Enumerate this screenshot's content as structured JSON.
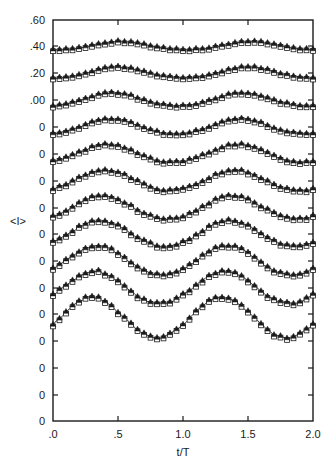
{
  "figure": {
    "background": "#ffffff",
    "ink": "#1a1a1a",
    "frame": {
      "left": 53,
      "right": 313,
      "top": 20,
      "bottom": 421
    }
  },
  "axes": {
    "x": {
      "label": "t/T",
      "ticks": [
        0.0,
        0.5,
        1.0,
        1.5,
        2.0
      ],
      "tick_labels": [
        ".0",
        ".5",
        "1.0",
        "1.5",
        "2.0"
      ],
      "range": [
        0.0,
        2.0
      ]
    },
    "y": {
      "label": "<I>",
      "tick_labels": [
        ".60",
        ".40",
        ".20",
        ".00",
        "0",
        "0",
        "0",
        "0",
        "0",
        "0",
        "0",
        "0",
        "0",
        "0",
        "0"
      ],
      "tick_values": [
        0.6,
        0.4,
        0.2,
        0.0,
        0,
        0,
        0,
        0,
        0,
        0,
        0,
        0,
        0,
        0,
        0
      ],
      "tick_pixels": [
        20,
        46,
        73,
        100,
        127,
        154,
        181,
        208,
        234,
        261,
        288,
        314,
        341,
        368,
        395
      ],
      "range_pixels": [
        421,
        20
      ],
      "note": "stacked offset traces; upper four ticks carry absolute values .00-.60, lower baselines all annotated 0"
    },
    "grid": false,
    "frame_sides": [
      "left",
      "right",
      "top",
      "bottom"
    ],
    "tick_direction": "in"
  },
  "legend": {
    "present": false
  },
  "markers": {
    "series_a": {
      "shape": "triangle-up",
      "fill": "#1a1a1a",
      "size": 4
    },
    "series_b": {
      "shape": "square-open",
      "fill": "#ffffff",
      "stroke": "#1a1a1a",
      "size": 4
    }
  },
  "chart_data": {
    "type": "line",
    "title": "",
    "subtitle": "",
    "xlabel": "t/T",
    "ylabel": "<I>",
    "xlim": [
      0.0,
      2.0
    ],
    "ylim": [
      0.0,
      0.6
    ],
    "grid": false,
    "legend_position": "none",
    "x": [
      0.0,
      0.025,
      0.05,
      0.075,
      0.1,
      0.125,
      0.15,
      0.175,
      0.2,
      0.225,
      0.25,
      0.275,
      0.3,
      0.325,
      0.35,
      0.375,
      0.4,
      0.425,
      0.45,
      0.475,
      0.5,
      0.525,
      0.55,
      0.575,
      0.6,
      0.625,
      0.65,
      0.675,
      0.7,
      0.725,
      0.75,
      0.775,
      0.8,
      0.825,
      0.85,
      0.875,
      0.9,
      0.925,
      0.95,
      0.975,
      1.0,
      1.025,
      1.05,
      1.075,
      1.1,
      1.125,
      1.15,
      1.175,
      1.2,
      1.225,
      1.25,
      1.275,
      1.3,
      1.325,
      1.35,
      1.375,
      1.4,
      1.425,
      1.45,
      1.475,
      1.5,
      1.525,
      1.55,
      1.575,
      1.6,
      1.625,
      1.65,
      1.675,
      1.7,
      1.725,
      1.75,
      1.775,
      1.8,
      1.825,
      1.85,
      1.875,
      1.9,
      1.925,
      1.95,
      1.975,
      2.0
    ],
    "series": [
      {
        "name": "trace-1",
        "baseline_pixel": 46,
        "amplitude": 0.03,
        "phase": 0.52,
        "harmonic2": 0.1,
        "marker_step": 2,
        "description": "lowest amplitude modulation about .40"
      },
      {
        "name": "trace-2",
        "baseline_pixel": 73,
        "amplitude": 0.04,
        "phase": 0.5,
        "harmonic2": 0.1,
        "marker_step": 2,
        "description": "modulation about .20"
      },
      {
        "name": "trace-3",
        "baseline_pixel": 100,
        "amplitude": 0.048,
        "phase": 0.46,
        "harmonic2": 0.08,
        "marker_step": 2,
        "description": "modulation about .00"
      },
      {
        "name": "trace-4",
        "baseline_pixel": 127,
        "amplitude": 0.056,
        "phase": 0.44,
        "harmonic2": 0.07,
        "marker_step": 2,
        "description": "offset baseline 0"
      },
      {
        "name": "trace-5",
        "baseline_pixel": 154,
        "amplitude": 0.066,
        "phase": 0.42,
        "harmonic2": 0.06,
        "marker_step": 2,
        "description": "offset baseline 0"
      },
      {
        "name": "trace-6",
        "baseline_pixel": 181,
        "amplitude": 0.076,
        "phase": 0.4,
        "harmonic2": 0.05,
        "marker_step": 2,
        "description": "offset baseline 0"
      },
      {
        "name": "trace-7",
        "baseline_pixel": 208,
        "amplitude": 0.086,
        "phase": 0.38,
        "harmonic2": 0.05,
        "marker_step": 2,
        "description": "offset baseline 0"
      },
      {
        "name": "trace-8",
        "baseline_pixel": 234,
        "amplitude": 0.096,
        "phase": 0.36,
        "harmonic2": 0.04,
        "marker_step": 2,
        "description": "offset baseline 0"
      },
      {
        "name": "trace-9",
        "baseline_pixel": 261,
        "amplitude": 0.108,
        "phase": 0.34,
        "harmonic2": 0.04,
        "marker_step": 2,
        "description": "offset baseline 0"
      },
      {
        "name": "trace-10",
        "baseline_pixel": 288,
        "amplitude": 0.12,
        "phase": 0.32,
        "harmonic2": 0.03,
        "marker_step": 2,
        "description": "offset baseline 0"
      },
      {
        "name": "trace-11",
        "baseline_pixel": 318,
        "amplitude": 0.15,
        "phase": 0.3,
        "harmonic2": 0.02,
        "marker_step": 2,
        "description": "largest amplitude, deep minima near t/T = 1.0 and 2.0"
      }
    ]
  }
}
